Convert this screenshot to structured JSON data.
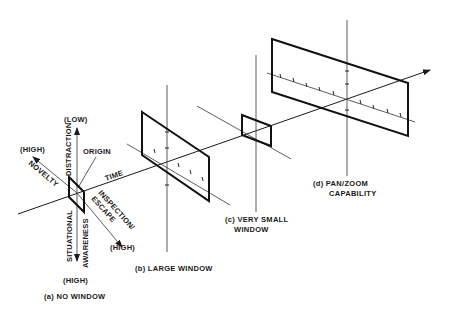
{
  "figure": {
    "axes": {
      "time": "TIME",
      "origin": "ORIGIN",
      "distraction": "DISTRACTION",
      "distraction_end": "(LOW)",
      "novelty": "NOVELTY",
      "novelty_end": "(HIGH)",
      "inspection_escape_line1": "INSPECTION/",
      "inspection_escape_line2": "ESCAPE",
      "inspection_end": "(HIGH)",
      "situational": "SITUATIONAL",
      "awareness": "AWARENESS",
      "awareness_end": "(HIGH)"
    },
    "panels": [
      {
        "id": "a",
        "label": "(a)  NO WINDOW"
      },
      {
        "id": "b",
        "label": "(b)  LARGE WINDOW"
      },
      {
        "id": "c",
        "label_line1": "(c) VERY SMALL",
        "label_line2": "WINDOW"
      },
      {
        "id": "d",
        "label_line1": "(d)  PAN/ZOOM",
        "label_line2": "CAPABILITY"
      }
    ],
    "colors": {
      "ink": "#1a1a1a",
      "background": "#ffffff"
    }
  }
}
